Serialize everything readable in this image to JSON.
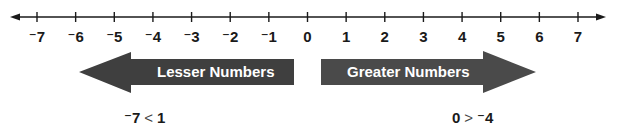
{
  "number_line": {
    "min": -7,
    "max": 7,
    "ticks": [
      "⁻7",
      "⁻6",
      "⁻5",
      "⁻4",
      "⁻3",
      "⁻2",
      "⁻1",
      "0",
      "1",
      "2",
      "3",
      "4",
      "5",
      "6",
      "7"
    ],
    "line_color": "#1a1a1a"
  },
  "arrows": {
    "left": {
      "label": "Lesser Numbers",
      "color": "#3f3f3f"
    },
    "right": {
      "label": "Greater Numbers",
      "color": "#4a4a4a"
    }
  },
  "examples": {
    "left": {
      "lhs": "⁻7",
      "op": "<",
      "rhs": "1"
    },
    "right": {
      "lhs": "0",
      "op": ">",
      "rhs": "⁻4"
    }
  }
}
